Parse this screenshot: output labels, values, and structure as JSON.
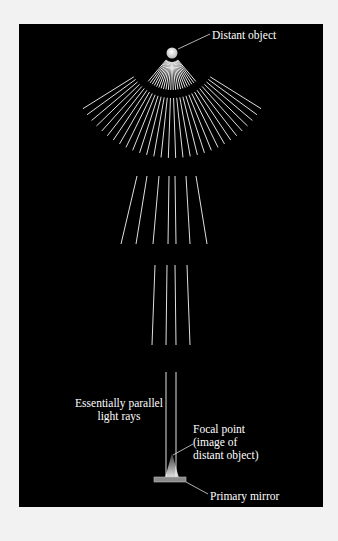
{
  "labels": {
    "distant_object": "Distant object",
    "parallel_line1": "Essentially parallel",
    "parallel_line2": "light rays",
    "focal_line1": "Focal point",
    "focal_line2": "(image of",
    "focal_line3": "distant object)",
    "primary_mirror": "Primary mirror"
  },
  "colors": {
    "background": "#f2f2f2",
    "panel": "#000000",
    "rays": "#e6e6e6",
    "mirror": "#8a8a8a"
  }
}
